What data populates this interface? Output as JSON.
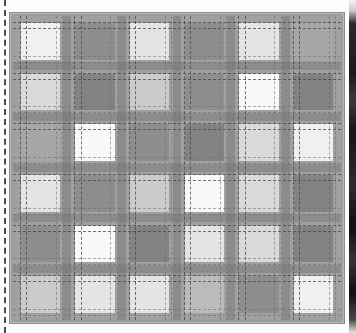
{
  "image": {
    "title": "Grayscale plaid / tartan swatch",
    "kind": "textile-pattern-swatch",
    "width_px": 356,
    "height_px": 333
  },
  "frame": {
    "left_px": 9,
    "top_px": 12,
    "width_px": 334,
    "height_px": 310,
    "border_color": "#8c8c8c",
    "ground_color": "#9d9d9d"
  },
  "guide_left": {
    "name": "dashed-guide-line",
    "x_px": 4,
    "style": "dashed",
    "color": "#4d4d4d"
  },
  "right_strip": {
    "name": "dark-edge-strip",
    "x_px": 349,
    "width_px": 7,
    "color": "#1b1b1b"
  },
  "palette": {
    "white": "#fbfbfb",
    "near_white": "#f2f2f2",
    "very_light": "#e7e7e7",
    "light": "#dcdcdc",
    "light_mid": "#cdcdcd",
    "mid": "#bdbdbd",
    "mid_dark": "#a8a8a8",
    "dark": "#8f8f8f",
    "darker": "#848484",
    "sash": "#737373",
    "ground": "#9d9d9d"
  },
  "grid": {
    "rows": 6,
    "cols": 6,
    "cells": [
      [
        "near_white",
        "dark",
        "very_light",
        "dark",
        "very_light",
        "mid_dark"
      ],
      [
        "light",
        "darker",
        "light_mid",
        "dark",
        "white",
        "darker"
      ],
      [
        "mid_dark",
        "white",
        "dark",
        "darker",
        "light",
        "near_white"
      ],
      [
        "very_light",
        "dark",
        "light_mid",
        "white",
        "light",
        "darker"
      ],
      [
        "dark",
        "white",
        "darker",
        "very_light",
        "light",
        "darker"
      ],
      [
        "light_mid",
        "very_light",
        "very_light",
        "mid",
        "dark",
        "near_white"
      ]
    ]
  },
  "sashes": {
    "vertical_positions_pct": [
      0,
      16.6,
      33.3,
      50,
      66.6,
      83.3,
      100
    ],
    "horizontal_positions_pct": [
      0,
      16.6,
      33.3,
      50,
      66.6,
      83.3,
      100
    ],
    "band_color": "#737373"
  },
  "dashes": {
    "style": "dashed",
    "color": "#464646",
    "faint_color": "#6e6e6e",
    "vertical_offsets_pct": [
      2,
      4,
      13,
      15,
      18.6,
      20.6,
      29.6,
      31.6,
      35.3,
      37.3,
      46.3,
      48.3,
      52,
      54,
      63,
      65,
      68.6,
      70.6,
      79.6,
      81.6,
      85.3,
      87.3,
      96.3,
      98.3
    ],
    "horizontal_offsets_pct": [
      2,
      4,
      13,
      15,
      18.6,
      20.6,
      29.6,
      31.6,
      35.3,
      37.3,
      46.3,
      48.3,
      52,
      54,
      63,
      65,
      68.6,
      70.6,
      79.6,
      81.6,
      85.3,
      87.3,
      96.3,
      98.3
    ]
  }
}
